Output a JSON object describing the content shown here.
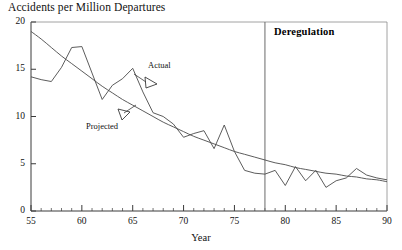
{
  "chart_data": {
    "type": "line",
    "title": "Accidents per Million Departures",
    "xlabel": "Year",
    "ylabel": "",
    "xlim": [
      55,
      90
    ],
    "ylim": [
      0,
      20
    ],
    "grid": false,
    "legend_position": "inline-annotations",
    "x_ticks": [
      55,
      60,
      65,
      70,
      75,
      80,
      85,
      90
    ],
    "y_ticks": [
      0,
      5,
      10,
      15,
      20
    ],
    "x_minor_tick_step": 1,
    "x": [
      55,
      56,
      57,
      58,
      59,
      60,
      61,
      62,
      63,
      64,
      65,
      66,
      67,
      68,
      69,
      70,
      71,
      72,
      73,
      74,
      75,
      76,
      77,
      78,
      79,
      80,
      81,
      82,
      83,
      84,
      85,
      86,
      87,
      88,
      89,
      90
    ],
    "series": [
      {
        "name": "Actual",
        "values": [
          14.2,
          13.9,
          13.7,
          15.2,
          17.3,
          17.4,
          14.6,
          11.8,
          13.3,
          14.0,
          15.1,
          12.6,
          10.4,
          10.0,
          9.2,
          7.8,
          8.2,
          8.5,
          6.6,
          9.1,
          6.3,
          4.3,
          4.0,
          3.9,
          4.3,
          2.7,
          4.7,
          3.2,
          4.3,
          2.5,
          3.2,
          3.5,
          4.5,
          3.8,
          3.5,
          3.3
        ]
      },
      {
        "name": "Projected",
        "values": [
          19.0,
          18.2,
          17.3,
          16.4,
          15.6,
          14.8,
          14.0,
          13.2,
          12.5,
          11.8,
          11.2,
          10.6,
          10.0,
          9.4,
          8.9,
          8.4,
          7.9,
          7.5,
          7.1,
          6.7,
          6.3,
          6.0,
          5.7,
          5.4,
          5.1,
          4.9,
          4.6,
          4.4,
          4.2,
          4.0,
          3.9,
          3.7,
          3.6,
          3.4,
          3.3,
          3.1
        ]
      }
    ],
    "annotations": [
      {
        "text": "Actual",
        "points_to_series": "Actual"
      },
      {
        "text": "Projected",
        "points_to_series": "Projected"
      },
      {
        "text": "Deregulation",
        "type": "vline",
        "x": 78
      }
    ]
  },
  "labels": {
    "title": "Accidents per Million Departures",
    "x_axis_title": "Year",
    "deregulation": "Deregulation",
    "actual": "Actual",
    "projected": "Projected"
  },
  "colors": {
    "axis": "#3a3a3a",
    "actual_line": "#4a4a4a",
    "projected_line": "#4a4a4a",
    "text": "#111111",
    "background": "#ffffff"
  }
}
